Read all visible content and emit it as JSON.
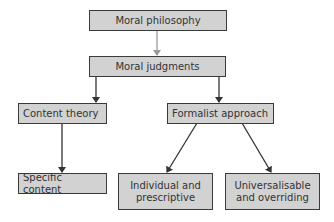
{
  "diagram": {
    "type": "hierarchy",
    "nodes": [
      {
        "id": "moral_philosophy",
        "label": "Moral philosophy"
      },
      {
        "id": "moral_judgments",
        "label": "Moral judgments"
      },
      {
        "id": "content_theory",
        "label": "Content theory"
      },
      {
        "id": "formalist_approach",
        "label": "Formalist approach"
      },
      {
        "id": "specific_content",
        "label": "Specific content"
      },
      {
        "id": "individual_prescriptive",
        "label": "Individual and prescriptive"
      },
      {
        "id": "universalisable_overriding",
        "label": "Universalisable and overriding"
      }
    ],
    "edges": [
      {
        "from": "moral_philosophy",
        "to": "moral_judgments"
      },
      {
        "from": "moral_judgments",
        "to": "content_theory"
      },
      {
        "from": "moral_judgments",
        "to": "formalist_approach"
      },
      {
        "from": "content_theory",
        "to": "specific_content"
      },
      {
        "from": "formalist_approach",
        "to": "individual_prescriptive"
      },
      {
        "from": "formalist_approach",
        "to": "universalisable_overriding"
      }
    ]
  },
  "labels": {
    "moral_philosophy": "Moral philosophy",
    "moral_judgments": "Moral judgments",
    "content_theory": "Content theory",
    "formalist_approach": "Formalist approach",
    "specific_content": "Specific content",
    "individual_line1": "Individual and",
    "individual_line2": "prescriptive",
    "universal_line1": "Universalisable",
    "universal_line2": "and overriding"
  },
  "colors": {
    "box_fill": "#d2d2d2",
    "box_border": "#3a3a3a",
    "text": "#333333",
    "arrow": "#333333",
    "arrow_light": "#999999"
  }
}
